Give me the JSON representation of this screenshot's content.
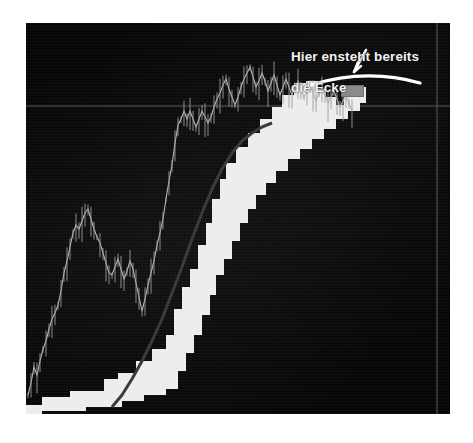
{
  "document": {
    "background_color": "#ffffff",
    "type": "annotated-trading-chart-screenshot"
  },
  "chart_panel": {
    "name": "price-chart-panel",
    "background_color": "#050505",
    "border_color": "#9a9a9a",
    "x": 26,
    "y": 23,
    "width": 424,
    "height": 391
  },
  "annotation": {
    "line1": "Hier ensteht bereits",
    "line2": "die Ecke",
    "text_color": "#f2f2f2",
    "marker_color": "#ffffff",
    "arc_label": "hand-drawn-arc-underline",
    "arrow_label": "hand-drawn-arrow"
  },
  "cursor": {
    "label": "chart-cursor-box",
    "color": "#8a8a8a",
    "x": 341,
    "y": 85,
    "width": 21,
    "height": 10
  },
  "gridlines": {
    "horizontal_y": 106,
    "vertical_x": 437,
    "color": "#5a5a5a"
  },
  "chart_data": {
    "type": "line",
    "title": "",
    "subtitle": "",
    "xlabel": "",
    "ylabel": "",
    "grid": true,
    "legend": "none",
    "xlim": [
      0,
      424
    ],
    "ylim": [
      0,
      391
    ],
    "axis_note": "unlabeled axes; values are chart-panel pixel coordinates read off the screenshot",
    "annotations": [
      {
        "text": "Hier ensteht bereits die Ecke",
        "x": 291,
        "y": 33,
        "points_to_x": 345,
        "points_to_y": 88,
        "kind": "hand-drawn text with arc and arrow"
      }
    ],
    "series": [
      {
        "name": "price-line",
        "type": "line",
        "color": "#b9b9b9",
        "points": [
          [
            2,
            372
          ],
          [
            5,
            360
          ],
          [
            8,
            344
          ],
          [
            11,
            352
          ],
          [
            14,
            338
          ],
          [
            17,
            326
          ],
          [
            20,
            318
          ],
          [
            23,
            306
          ],
          [
            26,
            296
          ],
          [
            29,
            290
          ],
          [
            32,
            282
          ],
          [
            35,
            268
          ],
          [
            38,
            250
          ],
          [
            41,
            238
          ],
          [
            44,
            224
          ],
          [
            47,
            210
          ],
          [
            50,
            202
          ],
          [
            53,
            206
          ],
          [
            56,
            198
          ],
          [
            59,
            190
          ],
          [
            62,
            186
          ],
          [
            65,
            196
          ],
          [
            68,
            206
          ],
          [
            71,
            214
          ],
          [
            74,
            220
          ],
          [
            77,
            230
          ],
          [
            80,
            240
          ],
          [
            83,
            250
          ],
          [
            86,
            252
          ],
          [
            89,
            244
          ],
          [
            92,
            236
          ],
          [
            95,
            246
          ],
          [
            98,
            256
          ],
          [
            101,
            248
          ],
          [
            104,
            238
          ],
          [
            107,
            246
          ],
          [
            110,
            260
          ],
          [
            113,
            274
          ],
          [
            116,
            288
          ],
          [
            119,
            276
          ],
          [
            122,
            262
          ],
          [
            125,
            250
          ],
          [
            128,
            238
          ],
          [
            131,
            222
          ],
          [
            134,
            210
          ],
          [
            137,
            196
          ],
          [
            140,
            176
          ],
          [
            143,
            158
          ],
          [
            146,
            142
          ],
          [
            149,
            120
          ],
          [
            152,
            102
          ],
          [
            155,
            96
          ],
          [
            158,
            88
          ],
          [
            161,
            96
          ],
          [
            164,
            88
          ],
          [
            167,
            96
          ],
          [
            170,
            104
          ],
          [
            173,
            96
          ],
          [
            176,
            88
          ],
          [
            179,
            94
          ],
          [
            182,
            100
          ],
          [
            185,
            94
          ],
          [
            188,
            84
          ],
          [
            191,
            76
          ],
          [
            194,
            70
          ],
          [
            197,
            62
          ],
          [
            200,
            56
          ],
          [
            203,
            66
          ],
          [
            206,
            74
          ],
          [
            209,
            82
          ],
          [
            212,
            74
          ],
          [
            215,
            64
          ],
          [
            218,
            56
          ],
          [
            221,
            50
          ],
          [
            224,
            44
          ],
          [
            227,
            54
          ],
          [
            230,
            64
          ],
          [
            233,
            58
          ],
          [
            236,
            50
          ],
          [
            239,
            58
          ],
          [
            242,
            68
          ],
          [
            245,
            60
          ],
          [
            248,
            52
          ],
          [
            251,
            62
          ],
          [
            254,
            72
          ],
          [
            257,
            64
          ],
          [
            260,
            56
          ],
          [
            263,
            64
          ],
          [
            266,
            72
          ],
          [
            269,
            64
          ],
          [
            272,
            58
          ],
          [
            275,
            66
          ],
          [
            278,
            74
          ],
          [
            281,
            68
          ],
          [
            284,
            62
          ],
          [
            287,
            70
          ],
          [
            290,
            78
          ],
          [
            293,
            70
          ],
          [
            296,
            64
          ],
          [
            299,
            72
          ],
          [
            302,
            80
          ],
          [
            305,
            74
          ],
          [
            308,
            68
          ],
          [
            311,
            76
          ],
          [
            314,
            84
          ],
          [
            317,
            78
          ],
          [
            320,
            72
          ],
          [
            323,
            80
          ],
          [
            326,
            88
          ]
        ]
      },
      {
        "name": "moving-average-curve",
        "type": "line",
        "color": "#3b3b3b",
        "points": [
          [
            86,
            384
          ],
          [
            96,
            372
          ],
          [
            106,
            356
          ],
          [
            116,
            338
          ],
          [
            126,
            318
          ],
          [
            136,
            296
          ],
          [
            146,
            270
          ],
          [
            156,
            244
          ],
          [
            166,
            216
          ],
          [
            176,
            190
          ],
          [
            186,
            166
          ],
          [
            196,
            146
          ],
          [
            206,
            130
          ],
          [
            216,
            118
          ],
          [
            226,
            110
          ],
          [
            236,
            104
          ],
          [
            246,
            100
          ]
        ]
      },
      {
        "name": "step-band-upper-edge",
        "type": "step",
        "color": "#ededed",
        "points": [
          [
            0,
            382
          ],
          [
            16,
            382
          ],
          [
            16,
            374
          ],
          [
            44,
            374
          ],
          [
            44,
            368
          ],
          [
            78,
            368
          ],
          [
            78,
            356
          ],
          [
            92,
            356
          ],
          [
            92,
            350
          ],
          [
            110,
            350
          ],
          [
            110,
            338
          ],
          [
            126,
            338
          ],
          [
            126,
            326
          ],
          [
            140,
            326
          ],
          [
            140,
            312
          ],
          [
            148,
            312
          ],
          [
            148,
            286
          ],
          [
            156,
            286
          ],
          [
            156,
            264
          ],
          [
            164,
            264
          ],
          [
            164,
            246
          ],
          [
            172,
            246
          ],
          [
            172,
            222
          ],
          [
            180,
            222
          ],
          [
            180,
            200
          ],
          [
            186,
            200
          ],
          [
            186,
            176
          ],
          [
            194,
            176
          ],
          [
            194,
            156
          ],
          [
            200,
            156
          ],
          [
            200,
            140
          ],
          [
            210,
            140
          ],
          [
            210,
            124
          ],
          [
            222,
            124
          ],
          [
            222,
            110
          ],
          [
            234,
            110
          ],
          [
            234,
            96
          ],
          [
            246,
            96
          ],
          [
            246,
            84
          ],
          [
            256,
            84
          ],
          [
            256,
            72
          ],
          [
            268,
            72
          ],
          [
            268,
            60
          ],
          [
            280,
            60
          ],
          [
            280,
            58
          ],
          [
            292,
            58
          ],
          [
            292,
            66
          ],
          [
            300,
            66
          ],
          [
            300,
            74
          ],
          [
            310,
            74
          ],
          [
            310,
            82
          ],
          [
            318,
            82
          ],
          [
            318,
            74
          ],
          [
            330,
            74
          ],
          [
            330,
            64
          ],
          [
            340,
            64
          ]
        ]
      },
      {
        "name": "step-band-lower-edge",
        "type": "step",
        "color": "#ededed",
        "points": [
          [
            0,
            391
          ],
          [
            16,
            391
          ],
          [
            16,
            388
          ],
          [
            60,
            388
          ],
          [
            60,
            384
          ],
          [
            96,
            384
          ],
          [
            96,
            378
          ],
          [
            118,
            378
          ],
          [
            118,
            372
          ],
          [
            140,
            372
          ],
          [
            140,
            366
          ],
          [
            152,
            366
          ],
          [
            152,
            348
          ],
          [
            160,
            348
          ],
          [
            160,
            330
          ],
          [
            168,
            330
          ],
          [
            168,
            312
          ],
          [
            176,
            312
          ],
          [
            176,
            292
          ],
          [
            184,
            292
          ],
          [
            184,
            272
          ],
          [
            190,
            272
          ],
          [
            190,
            252
          ],
          [
            198,
            252
          ],
          [
            198,
            236
          ],
          [
            206,
            236
          ],
          [
            206,
            218
          ],
          [
            214,
            218
          ],
          [
            214,
            200
          ],
          [
            222,
            200
          ],
          [
            222,
            186
          ],
          [
            230,
            186
          ],
          [
            230,
            172
          ],
          [
            240,
            172
          ],
          [
            240,
            160
          ],
          [
            250,
            160
          ],
          [
            250,
            148
          ],
          [
            262,
            148
          ],
          [
            262,
            136
          ],
          [
            274,
            136
          ],
          [
            274,
            126
          ],
          [
            286,
            126
          ],
          [
            286,
            116
          ],
          [
            298,
            116
          ],
          [
            298,
            106
          ],
          [
            310,
            106
          ],
          [
            310,
            96
          ],
          [
            322,
            96
          ],
          [
            322,
            88
          ],
          [
            334,
            88
          ],
          [
            334,
            80
          ],
          [
            340,
            80
          ]
        ]
      }
    ]
  }
}
